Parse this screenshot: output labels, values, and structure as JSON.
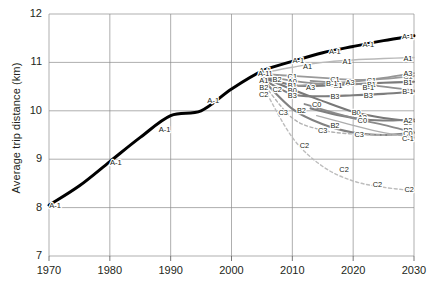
{
  "chart_data": {
    "type": "line",
    "title": "",
    "xlabel": "",
    "ylabel": "Average trip distance (km)",
    "xlim": [
      1970,
      2030
    ],
    "ylim": [
      7,
      12
    ],
    "xticks": [
      1970,
      1980,
      1990,
      2000,
      2010,
      2020,
      2030
    ],
    "yticks": [
      7,
      8,
      9,
      10,
      11,
      12
    ],
    "grid": true,
    "legend": "inline-labels",
    "label_note": "Each line is labelled inline with its scenario code repeated along its length",
    "series": [
      {
        "name": "A-1",
        "style": "thick-black-solid",
        "color": "#000000",
        "x": [
          1970,
          1975,
          1980,
          1985,
          1990,
          1995,
          2000,
          2005,
          2010,
          2015,
          2020,
          2025,
          2030
        ],
        "y": [
          8.05,
          8.45,
          8.95,
          9.45,
          9.9,
          10.0,
          10.45,
          10.82,
          11.02,
          11.2,
          11.33,
          11.45,
          11.55
        ],
        "inline_labels": [
          {
            "x": 1971,
            "y": 8.05
          },
          {
            "x": 1981,
            "y": 8.95
          },
          {
            "x": 1989,
            "y": 9.62
          },
          {
            "x": 1997,
            "y": 10.22
          },
          {
            "x": 2005.5,
            "y": 10.85
          },
          {
            "x": 2011,
            "y": 11.05
          },
          {
            "x": 2017,
            "y": 11.25
          },
          {
            "x": 2022.5,
            "y": 11.38
          },
          {
            "x": 2029,
            "y": 11.55
          }
        ]
      },
      {
        "name": "A1",
        "style": "light-gray-solid",
        "color": "#b9b9b9",
        "x": [
          2005,
          2010,
          2015,
          2020,
          2025,
          2030
        ],
        "y": [
          10.78,
          10.9,
          11.0,
          11.05,
          11.08,
          11.1
        ],
        "inline_labels": [
          {
            "x": 2006,
            "y": 10.78
          },
          {
            "x": 2012.5,
            "y": 10.93
          },
          {
            "x": 2019,
            "y": 11.04
          },
          {
            "x": 2029,
            "y": 11.1
          }
        ]
      },
      {
        "name": "C1",
        "style": "mid-gray-solid",
        "color": "#9a9a9a",
        "x": [
          2005,
          2010,
          2015,
          2020,
          2025,
          2030
        ],
        "y": [
          10.76,
          10.72,
          10.68,
          10.64,
          10.66,
          10.72
        ],
        "inline_labels": [
          {
            "x": 2010,
            "y": 10.72
          },
          {
            "x": 2017,
            "y": 10.66
          },
          {
            "x": 2023,
            "y": 10.64
          },
          {
            "x": 2029,
            "y": 10.72
          }
        ]
      },
      {
        "name": "A0",
        "style": "mid-gray-solid",
        "color": "#8f8f8f",
        "x": [
          2005,
          2010,
          2015
        ],
        "y": [
          10.74,
          10.62,
          10.55
        ],
        "inline_labels": [
          {
            "x": 2010,
            "y": 10.62
          }
        ]
      },
      {
        "name": "B1",
        "style": "dark-gray-solid",
        "color": "#7a7a7a",
        "x": [
          2005,
          2010,
          2015,
          2020,
          2025,
          2030
        ],
        "y": [
          10.72,
          10.53,
          10.52,
          10.55,
          10.58,
          10.6
        ],
        "inline_labels": [
          {
            "x": 2010,
            "y": 10.53
          },
          {
            "x": 2017.5,
            "y": 10.54
          },
          {
            "x": 2023,
            "y": 10.56
          },
          {
            "x": 2029,
            "y": 10.6
          }
        ]
      },
      {
        "name": "B-1",
        "style": "mid-gray-solid",
        "color": "#909090",
        "x": [
          2013,
          2017,
          2020,
          2025,
          2030
        ],
        "y": [
          10.62,
          10.58,
          10.56,
          10.5,
          10.42
        ],
        "inline_labels": [
          {
            "x": 2016.5,
            "y": 10.58
          },
          {
            "x": 2022.5,
            "y": 10.5
          },
          {
            "x": 2029,
            "y": 10.42
          }
        ]
      },
      {
        "name": "B0",
        "style": "dark-gray-solid",
        "color": "#787878",
        "x": [
          2005,
          2010,
          2015,
          2020,
          2025,
          2030
        ],
        "y": [
          10.7,
          10.44,
          10.2,
          9.98,
          9.85,
          9.78
        ],
        "inline_labels": [
          {
            "x": 2010,
            "y": 10.44
          },
          {
            "x": 2020.5,
            "y": 9.98
          },
          {
            "x": 2029,
            "y": 9.78
          }
        ]
      },
      {
        "name": "B3",
        "style": "dark-gray-solid",
        "color": "#7d7d7d",
        "x": [
          2005,
          2010,
          2015,
          2020,
          2025,
          2030
        ],
        "y": [
          10.66,
          10.34,
          10.3,
          10.32,
          10.35,
          10.4
        ],
        "inline_labels": [
          {
            "x": 2010,
            "y": 10.34
          },
          {
            "x": 2017,
            "y": 10.31
          },
          {
            "x": 2022.5,
            "y": 10.33
          }
        ]
      },
      {
        "name": "A3",
        "style": "mid-gray-solid",
        "color": "#969696",
        "x": [
          2010,
          2015,
          2020,
          2025,
          2030
        ],
        "y": [
          10.5,
          10.56,
          10.6,
          10.68,
          10.78
        ],
        "inline_labels": [
          {
            "x": 2013,
            "y": 10.5
          },
          {
            "x": 2019.5,
            "y": 10.6
          },
          {
            "x": 2029,
            "y": 10.78
          }
        ]
      },
      {
        "name": "A2",
        "style": "dark-gray-solid",
        "color": "#7f7f7f",
        "x": [
          2013,
          2018,
          2022,
          2026,
          2030
        ],
        "y": [
          10.05,
          9.9,
          9.82,
          9.8,
          9.82
        ],
        "inline_labels": [
          {
            "x": 2021.5,
            "y": 9.88
          },
          {
            "x": 2029,
            "y": 9.82
          }
        ]
      },
      {
        "name": "B2",
        "style": "dark-gray-solid",
        "color": "#818181",
        "x": [
          2005,
          2010,
          2015,
          2020,
          2025,
          2030
        ],
        "y": [
          10.66,
          10.04,
          9.72,
          9.55,
          9.5,
          9.55
        ],
        "inline_labels": [
          {
            "x": 2007.5,
            "y": 10.66
          },
          {
            "x": 2011.5,
            "y": 10.02
          },
          {
            "x": 2017,
            "y": 9.72
          },
          {
            "x": 2029,
            "y": 9.6
          }
        ]
      },
      {
        "name": "C0",
        "style": "mid-gray-solid",
        "color": "#8a8a8a",
        "x": [
          2012,
          2017,
          2021,
          2026,
          2030
        ],
        "y": [
          10.14,
          9.95,
          9.82,
          9.68,
          9.55
        ],
        "inline_labels": [
          {
            "x": 2014,
            "y": 10.14
          },
          {
            "x": 2021.5,
            "y": 9.82
          },
          {
            "x": 2029,
            "y": 9.55
          }
        ]
      },
      {
        "name": "C3",
        "style": "light-gray-dashed",
        "color": "#b2b2b2",
        "x": [
          2005,
          2010,
          2015,
          2020,
          2025,
          2030
        ],
        "y": [
          10.6,
          9.85,
          9.6,
          9.52,
          9.5,
          9.5
        ],
        "inline_labels": [
          {
            "x": 2008.5,
            "y": 9.98
          },
          {
            "x": 2015,
            "y": 9.6
          },
          {
            "x": 2021,
            "y": 9.52
          }
        ]
      },
      {
        "name": "C-1",
        "style": "light-gray-solid",
        "color": "#adadad",
        "x": [
          2014,
          2020,
          2025,
          2030
        ],
        "y": [
          9.9,
          9.7,
          9.55,
          9.45
        ],
        "inline_labels": [
          {
            "x": 2029,
            "y": 9.45
          }
        ]
      },
      {
        "name": "C2",
        "style": "light-gray-dashed",
        "color": "#bdbdbd",
        "x": [
          2005,
          2010,
          2015,
          2020,
          2025,
          2030
        ],
        "y": [
          10.55,
          9.45,
          8.85,
          8.55,
          8.42,
          8.35
        ],
        "inline_labels": [
          {
            "x": 2007.5,
            "y": 10.45
          },
          {
            "x": 2012,
            "y": 9.3
          },
          {
            "x": 2018.5,
            "y": 8.8
          },
          {
            "x": 2024,
            "y": 8.5
          },
          {
            "x": 2029.2,
            "y": 8.38
          }
        ]
      },
      {
        "name": "branch-stack-2005",
        "style": "label-only",
        "color": "#333333",
        "x": [],
        "y": [],
        "inline_labels": [
          {
            "x": 2005.3,
            "y": 10.78,
            "text": "A-1"
          },
          {
            "x": 2005.3,
            "y": 10.64,
            "text": "A1"
          },
          {
            "x": 2005.3,
            "y": 10.5,
            "text": "B2"
          },
          {
            "x": 2005.3,
            "y": 10.36,
            "text": "C2"
          }
        ]
      }
    ]
  }
}
